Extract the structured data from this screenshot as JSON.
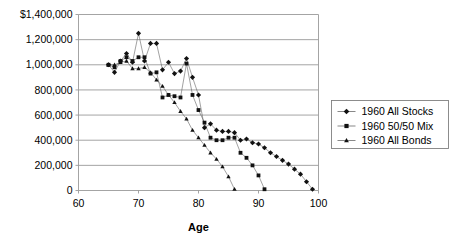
{
  "chart_data": {
    "type": "scatter",
    "title": "",
    "subtitle": "",
    "xlabel": "Age",
    "ylabel": "",
    "xlim": [
      60,
      100
    ],
    "ylim": [
      0,
      1400000
    ],
    "xticks": [
      60,
      70,
      80,
      90,
      100
    ],
    "xtick_labels": [
      "60",
      "70",
      "80",
      "90",
      "100"
    ],
    "yticks": [
      0,
      200000,
      400000,
      600000,
      800000,
      1000000,
      1200000,
      1400000
    ],
    "ytick_labels": [
      "0",
      "200,000",
      "400,000",
      "600,000",
      "800,000",
      "1,000,000",
      "1,200,000",
      "$1,400,000"
    ],
    "grid": "horizontal",
    "legend_position": "right",
    "markers_only": false,
    "series": [
      {
        "name": "1960 All Stocks",
        "marker": "diamond",
        "color": "#111111",
        "x": [
          65,
          66,
          67,
          68,
          69,
          70,
          71,
          72,
          73,
          74,
          75,
          76,
          77,
          78,
          79,
          80,
          81,
          82,
          83,
          84,
          85,
          86,
          87,
          88,
          89,
          90,
          91,
          92,
          93,
          94,
          95,
          96,
          97,
          98,
          99
        ],
        "y": [
          1000000,
          940000,
          1030000,
          1090000,
          1020000,
          1250000,
          1030000,
          1170000,
          1170000,
          960000,
          1020000,
          930000,
          950000,
          1050000,
          900000,
          760000,
          500000,
          530000,
          480000,
          470000,
          470000,
          460000,
          400000,
          410000,
          380000,
          370000,
          340000,
          300000,
          270000,
          240000,
          210000,
          170000,
          130000,
          70000,
          10000
        ]
      },
      {
        "name": "1960 50/50 Mix",
        "marker": "square",
        "color": "#111111",
        "x": [
          65,
          66,
          67,
          68,
          69,
          70,
          71,
          72,
          73,
          74,
          75,
          76,
          77,
          78,
          79,
          80,
          81,
          82,
          83,
          84,
          85,
          86,
          87,
          88,
          89,
          90,
          91
        ],
        "y": [
          1000000,
          980000,
          1030000,
          1060000,
          1030000,
          1060000,
          1060000,
          930000,
          940000,
          740000,
          760000,
          750000,
          740000,
          1010000,
          760000,
          640000,
          540000,
          420000,
          400000,
          400000,
          420000,
          420000,
          300000,
          260000,
          200000,
          120000,
          10000
        ]
      },
      {
        "name": "1960 All Bonds",
        "marker": "triangle",
        "color": "#111111",
        "x": [
          65,
          66,
          67,
          68,
          69,
          70,
          71,
          72,
          73,
          74,
          75,
          76,
          77,
          78,
          79,
          80,
          81,
          82,
          83,
          84,
          85,
          86
        ],
        "y": [
          1000000,
          1000000,
          1020000,
          1030000,
          970000,
          970000,
          980000,
          940000,
          880000,
          830000,
          760000,
          700000,
          630000,
          570000,
          480000,
          420000,
          360000,
          300000,
          250000,
          190000,
          110000,
          10000
        ]
      }
    ]
  },
  "legend": {
    "items": [
      {
        "label": "1960 All Stocks",
        "marker": "diamond"
      },
      {
        "label": "1960 50/50 Mix",
        "marker": "square"
      },
      {
        "label": "1960 All Bonds",
        "marker": "triangle"
      }
    ]
  }
}
